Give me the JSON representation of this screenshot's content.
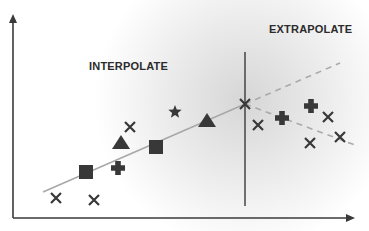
{
  "labels": {
    "interpolate": "INTERPOLATE",
    "extrapolate": "EXTRAPOLATE"
  },
  "colors": {
    "background": "#ffffff",
    "shade": "#d8d8d8",
    "axis": "#3a3a3a",
    "marker": "#383838",
    "fit_line": "#a8a8a8",
    "dashed_line": "#aaaaaa",
    "text": "#2b2b2b"
  },
  "axes": {
    "x_axis": {
      "x1": 13,
      "y1": 218,
      "x2": 355,
      "y2": 218
    },
    "y_axis": {
      "x1": 13,
      "y1": 218,
      "x2": 13,
      "y2": 14
    }
  },
  "divider": {
    "x": 245,
    "y1": 52,
    "y2": 206
  },
  "fit_line": {
    "x1": 43,
    "y1": 192,
    "x2": 245,
    "y2": 104
  },
  "extrapolation_lines": [
    {
      "name": "upper-dashed",
      "x1": 245,
      "y1": 104,
      "x2": 340,
      "y2": 63
    },
    {
      "name": "lower-dashed",
      "x1": 245,
      "y1": 104,
      "x2": 355,
      "y2": 145
    }
  ],
  "markers": [
    {
      "shape": "x",
      "x": 56,
      "y": 198
    },
    {
      "shape": "x",
      "x": 94,
      "y": 200
    },
    {
      "shape": "square",
      "x": 86,
      "y": 172
    },
    {
      "shape": "plus",
      "x": 118,
      "y": 168
    },
    {
      "shape": "triangle",
      "x": 121,
      "y": 143
    },
    {
      "shape": "x",
      "x": 130,
      "y": 127
    },
    {
      "shape": "square",
      "x": 156,
      "y": 147
    },
    {
      "shape": "star",
      "x": 175,
      "y": 112
    },
    {
      "shape": "triangle",
      "x": 207,
      "y": 121
    },
    {
      "shape": "x",
      "x": 245,
      "y": 104
    },
    {
      "shape": "x",
      "x": 258,
      "y": 125
    },
    {
      "shape": "plus",
      "x": 282,
      "y": 118
    },
    {
      "shape": "plus",
      "x": 311,
      "y": 106
    },
    {
      "shape": "x",
      "x": 328,
      "y": 117
    },
    {
      "shape": "x",
      "x": 310,
      "y": 143
    },
    {
      "shape": "x",
      "x": 340,
      "y": 137
    }
  ]
}
